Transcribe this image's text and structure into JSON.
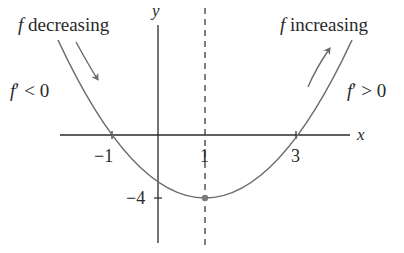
{
  "labels": {
    "y_axis": "y",
    "x_axis": "x",
    "decreasing_f": "f",
    "decreasing_text": " decreasing",
    "increasing_f": "f",
    "increasing_text": " increasing",
    "deriv_neg_f": "f",
    "deriv_neg_rest": "′ < 0",
    "deriv_pos_f": "f",
    "deriv_pos_rest": "′ > 0",
    "tick_neg1": "−1",
    "tick_1": "1",
    "tick_3": "3",
    "tick_neg4": "−4"
  },
  "function": {
    "expression": "f(x) = (x − 1)² − 4",
    "roots": [
      -1,
      3
    ],
    "vertex": [
      1,
      -4
    ]
  },
  "colors": {
    "curve": "#6b6b6b",
    "axis": "#2a2a2a",
    "text": "#2a2a2a",
    "vertex_dot": "#7a7a7a"
  }
}
